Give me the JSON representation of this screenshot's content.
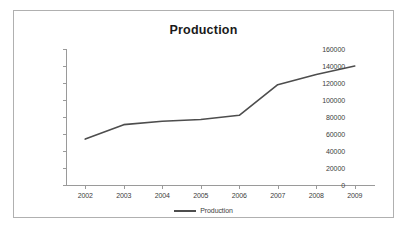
{
  "chart_data": {
    "type": "line",
    "title": "Production",
    "xlabel": "",
    "ylabel": "",
    "categories": [
      "2002",
      "2003",
      "2004",
      "2005",
      "2006",
      "2007",
      "2008",
      "2009"
    ],
    "series": [
      {
        "name": "Production",
        "values": [
          54000,
          71000,
          75000,
          77000,
          82000,
          118000,
          130000,
          140000
        ],
        "color": "#4d4d4d"
      }
    ],
    "ylim": [
      0,
      160000
    ],
    "y_ticks": [
      0,
      20000,
      40000,
      60000,
      80000,
      100000,
      120000,
      140000,
      160000
    ],
    "y_tick_labels": [
      "0",
      "20000",
      "40000",
      "60000",
      "80000",
      "100000",
      "120000",
      "140000",
      "160000"
    ],
    "grid": false,
    "legend": {
      "position": "bottom",
      "entries": [
        "Production"
      ]
    },
    "axis_color": "#9a9a9a",
    "text_color": "#3d3d3d",
    "border_color": "#b0b0b0",
    "background": "#ffffff"
  }
}
